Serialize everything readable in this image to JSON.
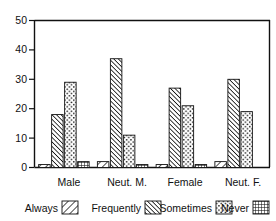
{
  "chart_data": {
    "type": "bar",
    "title": "",
    "subtitle": "",
    "xlabel": "",
    "ylabel": "",
    "categories": [
      "Male",
      "Neut. M.",
      "Female",
      "Neut. F."
    ],
    "series": [
      {
        "name": "Always",
        "pattern": "diagonal-up-hatch",
        "values": [
          1,
          2,
          1,
          2
        ]
      },
      {
        "name": "Frequently",
        "pattern": "diagonal-down-hatch",
        "values": [
          18,
          37,
          27,
          30
        ]
      },
      {
        "name": "Sometimes",
        "pattern": "dotted",
        "values": [
          29,
          11,
          21,
          19
        ]
      },
      {
        "name": "Never",
        "pattern": "grid-crosshatch",
        "values": [
          2,
          1,
          1,
          0
        ]
      }
    ],
    "ylim": [
      0,
      50
    ],
    "yticks": [
      0,
      10,
      20,
      30,
      40,
      50
    ],
    "ytick_labels": [
      "0",
      "10",
      "20",
      "30",
      "40",
      "50"
    ],
    "grid": false,
    "legend_position": "bottom",
    "legend_entries": [
      "Always",
      "Frequently",
      "Sometimes",
      "Never"
    ],
    "axis_color": "#111111",
    "background_color": "#ffffff"
  },
  "axis": {
    "y_labels": [
      "50",
      "40",
      "30",
      "20",
      "10",
      "0"
    ]
  },
  "categories": {
    "c0": "Male",
    "c1": "Neut. M.",
    "c2": "Female",
    "c3": "Neut. F."
  },
  "legend": {
    "always": "Always",
    "frequently": "Frequently",
    "sometimes": "Sometimes",
    "never": "Never"
  }
}
